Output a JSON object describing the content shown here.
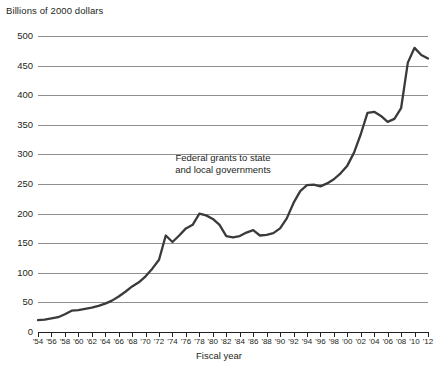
{
  "chart_data": {
    "type": "line",
    "title": "",
    "ylabel": "Billions of 2000 dollars",
    "xlabel": "Fiscal year",
    "annotation": {
      "line1": "Federal grants to state",
      "line2": "and local governments"
    },
    "ylim": [
      0,
      500
    ],
    "ytick_values": [
      0,
      50,
      100,
      150,
      200,
      250,
      300,
      350,
      400,
      450,
      500
    ],
    "ytick_labels": [
      "0",
      "50",
      "100",
      "150",
      "200",
      "250",
      "300",
      "350",
      "400",
      "450",
      "500"
    ],
    "grid": true,
    "legend": "none",
    "xlim": [
      1954,
      2012
    ],
    "xtick_values": [
      1954,
      1956,
      1958,
      1960,
      1962,
      1964,
      1966,
      1968,
      1970,
      1972,
      1974,
      1976,
      1978,
      1980,
      1982,
      1984,
      1986,
      1988,
      1990,
      1992,
      1994,
      1996,
      1998,
      2000,
      2002,
      2004,
      2006,
      2008,
      2010,
      2012
    ],
    "xtick_labels": [
      "'54",
      "'56",
      "'58",
      "'60",
      "'62",
      "'64",
      "'66",
      "'68",
      "'70",
      "'72",
      "'74",
      "'76",
      "'78",
      "'80",
      "'82",
      "'84",
      "'86",
      "'88",
      "'90",
      "'92",
      "'94",
      "'96",
      "'98",
      "'00",
      "'02",
      "'04",
      "'06",
      "'08",
      "'10",
      "'12"
    ],
    "series": [
      {
        "name": "Federal grants to state and local governments",
        "color": "#3a3a3a",
        "x": [
          1954,
          1955,
          1956,
          1957,
          1958,
          1959,
          1960,
          1961,
          1962,
          1963,
          1964,
          1965,
          1966,
          1967,
          1968,
          1969,
          1970,
          1971,
          1972,
          1973,
          1974,
          1975,
          1976,
          1977,
          1978,
          1979,
          1980,
          1981,
          1982,
          1983,
          1984,
          1985,
          1986,
          1987,
          1988,
          1989,
          1990,
          1991,
          1992,
          1993,
          1994,
          1995,
          1996,
          1997,
          1998,
          1999,
          2000,
          2001,
          2002,
          2003,
          2004,
          2005,
          2006,
          2007,
          2008,
          2009,
          2010,
          2011,
          2012
        ],
        "values": [
          20,
          21,
          23,
          25,
          30,
          36,
          37,
          39,
          41,
          44,
          48,
          53,
          60,
          68,
          77,
          84,
          94,
          107,
          122,
          163,
          152,
          163,
          175,
          181,
          200,
          197,
          191,
          181,
          162,
          160,
          162,
          168,
          172,
          163,
          164,
          167,
          175,
          192,
          218,
          238,
          248,
          249,
          246,
          251,
          258,
          268,
          281,
          303,
          334,
          370,
          372,
          365,
          355,
          360,
          378,
          455,
          480,
          468,
          462
        ]
      }
    ]
  }
}
